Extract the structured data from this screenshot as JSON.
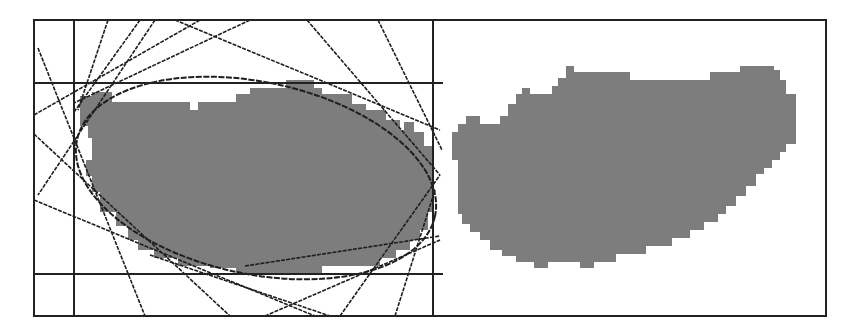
{
  "figure": {
    "colors": {
      "background": "#ffffff",
      "frame": "#222222",
      "lines": "#1e1e1e",
      "blob_fill": "#7d7d7d"
    },
    "frame": {
      "left": 34,
      "top": 20,
      "right": 826,
      "bottom": 316,
      "divider_x": 433
    },
    "panels": [
      {
        "id": "left",
        "label": "blob with tangent-line ellipse",
        "bounding_lines": {
          "vertical_x": 74,
          "horizontal_y": [
            83,
            274
          ]
        },
        "ellipse": {
          "cx": 256,
          "cy": 178,
          "rx": 183,
          "ry": 96,
          "rotation_deg": 12
        }
      },
      {
        "id": "right",
        "label": "isolated blob"
      }
    ]
  }
}
